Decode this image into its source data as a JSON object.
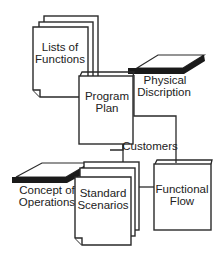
{
  "diagram": {
    "colors": {
      "stroke": "#2a2a2a",
      "fill": "#ffffff",
      "slab": "#1a1a1a",
      "text": "#222222"
    },
    "nodes": {
      "lists_of_functions": {
        "line1": "Lists of",
        "line2": "Functions",
        "shape": "stacked-pages"
      },
      "program_plan": {
        "line1": "Program",
        "line2": "Plan",
        "shape": "binder"
      },
      "physical_discription": {
        "line1": "Physical",
        "line2": "Discription",
        "shape": "slab"
      },
      "customers": {
        "label": "Customers",
        "shape": "label"
      },
      "concept_of_operations": {
        "line1": "Concept of",
        "line2": "Operations",
        "shape": "slab"
      },
      "standard_scenarios": {
        "line1": "Standard",
        "line2": "Scenarios",
        "shape": "stacked-pages"
      },
      "functional_flow": {
        "line1": "Functional",
        "line2": "Flow",
        "shape": "binder"
      }
    },
    "edges": [
      {
        "from": "program_plan",
        "to": "physical_discription"
      },
      {
        "from": "program_plan",
        "to": "customers"
      },
      {
        "from": "customers",
        "to": "functional_flow"
      },
      {
        "from": "standard_scenarios",
        "to": "functional_flow"
      }
    ]
  }
}
